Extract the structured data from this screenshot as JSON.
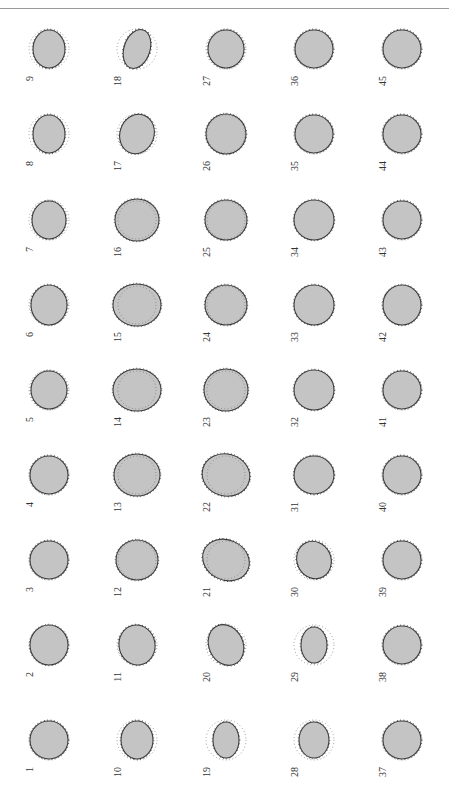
{
  "page": {
    "header_text": "",
    "page_number": "",
    "orientation": "rotated-90"
  },
  "figure": {
    "columns": [
      49,
      137,
      226,
      314,
      402
    ],
    "rows": [
      49,
      134,
      220,
      305,
      390,
      475,
      560,
      645,
      740
    ],
    "colors": {
      "fill": "#c4c4c4",
      "edge": "#3a3a3a",
      "reference": "#6a6a6a"
    },
    "panels": [
      {
        "n": "1",
        "col": 0,
        "row": 8,
        "rx": 19,
        "ry": 19,
        "rot": 0,
        "ref": 19,
        "inner": false
      },
      {
        "n": "2",
        "col": 0,
        "row": 7,
        "rx": 19,
        "ry": 20,
        "rot": 0,
        "ref": 19,
        "inner": false
      },
      {
        "n": "3",
        "col": 0,
        "row": 6,
        "rx": 19,
        "ry": 19,
        "rot": 0,
        "ref": 19,
        "inner": false
      },
      {
        "n": "4",
        "col": 0,
        "row": 5,
        "rx": 19,
        "ry": 19,
        "rot": 0,
        "ref": 19,
        "inner": false
      },
      {
        "n": "5",
        "col": 0,
        "row": 4,
        "rx": 18,
        "ry": 19,
        "rot": 0,
        "ref": 19,
        "inner": false
      },
      {
        "n": "6",
        "col": 0,
        "row": 3,
        "rx": 18,
        "ry": 20,
        "rot": 0,
        "ref": 19,
        "inner": false
      },
      {
        "n": "7",
        "col": 0,
        "row": 2,
        "rx": 17,
        "ry": 19,
        "rot": 0,
        "ref": 19,
        "inner": false
      },
      {
        "n": "8",
        "col": 0,
        "row": 1,
        "rx": 16,
        "ry": 19,
        "rot": 0,
        "ref": 19,
        "inner": false
      },
      {
        "n": "9",
        "col": 0,
        "row": 0,
        "rx": 16,
        "ry": 19,
        "rot": 0,
        "ref": 19,
        "inner": false
      },
      {
        "n": "10",
        "col": 1,
        "row": 8,
        "rx": 16,
        "ry": 19,
        "rot": 0,
        "ref": 19,
        "inner": false
      },
      {
        "n": "11",
        "col": 1,
        "row": 7,
        "rx": 18,
        "ry": 20,
        "rot": -10,
        "ref": 19,
        "inner": false
      },
      {
        "n": "12",
        "col": 1,
        "row": 6,
        "rx": 21,
        "ry": 20,
        "rot": 0,
        "ref": 19,
        "inner": true
      },
      {
        "n": "13",
        "col": 1,
        "row": 5,
        "rx": 23,
        "ry": 21,
        "rot": 0,
        "ref": 19,
        "inner": true
      },
      {
        "n": "14",
        "col": 1,
        "row": 4,
        "rx": 24,
        "ry": 21,
        "rot": 0,
        "ref": 19,
        "inner": true
      },
      {
        "n": "15",
        "col": 1,
        "row": 3,
        "rx": 24,
        "ry": 21,
        "rot": 0,
        "ref": 19,
        "inner": true
      },
      {
        "n": "16",
        "col": 1,
        "row": 2,
        "rx": 22,
        "ry": 21,
        "rot": 0,
        "ref": 19,
        "inner": true
      },
      {
        "n": "17",
        "col": 1,
        "row": 1,
        "rx": 17,
        "ry": 20,
        "rot": 20,
        "ref": 19,
        "inner": false
      },
      {
        "n": "18",
        "col": 1,
        "row": 0,
        "rx": 13,
        "ry": 20,
        "rot": 18,
        "ref": 19,
        "inner": false
      },
      {
        "n": "19",
        "col": 2,
        "row": 8,
        "rx": 13,
        "ry": 18,
        "rot": 0,
        "ref": 19,
        "inner": false
      },
      {
        "n": "20",
        "col": 2,
        "row": 7,
        "rx": 17,
        "ry": 21,
        "rot": -25,
        "ref": 19,
        "inner": false
      },
      {
        "n": "21",
        "col": 2,
        "row": 6,
        "rx": 24,
        "ry": 20,
        "rot": 25,
        "ref": 19,
        "inner": true
      },
      {
        "n": "22",
        "col": 2,
        "row": 5,
        "rx": 24,
        "ry": 21,
        "rot": 15,
        "ref": 19,
        "inner": true
      },
      {
        "n": "23",
        "col": 2,
        "row": 4,
        "rx": 22,
        "ry": 21,
        "rot": 0,
        "ref": 19,
        "inner": true
      },
      {
        "n": "24",
        "col": 2,
        "row": 3,
        "rx": 21,
        "ry": 20,
        "rot": 0,
        "ref": 19,
        "inner": true
      },
      {
        "n": "25",
        "col": 2,
        "row": 2,
        "rx": 21,
        "ry": 20,
        "rot": 0,
        "ref": 19,
        "inner": true
      },
      {
        "n": "26",
        "col": 2,
        "row": 1,
        "rx": 20,
        "ry": 20,
        "rot": 0,
        "ref": 19,
        "inner": true
      },
      {
        "n": "27",
        "col": 2,
        "row": 0,
        "rx": 18,
        "ry": 19,
        "rot": 0,
        "ref": 19,
        "inner": false
      },
      {
        "n": "28",
        "col": 3,
        "row": 8,
        "rx": 15,
        "ry": 18,
        "rot": 0,
        "ref": 19,
        "inner": false
      },
      {
        "n": "29",
        "col": 3,
        "row": 7,
        "rx": 13,
        "ry": 18,
        "rot": 0,
        "ref": 19,
        "inner": false
      },
      {
        "n": "30",
        "col": 3,
        "row": 6,
        "rx": 17,
        "ry": 19,
        "rot": -25,
        "ref": 19,
        "inner": false
      },
      {
        "n": "31",
        "col": 3,
        "row": 5,
        "rx": 20,
        "ry": 19,
        "rot": 0,
        "ref": 19,
        "inner": false
      },
      {
        "n": "32",
        "col": 3,
        "row": 4,
        "rx": 20,
        "ry": 20,
        "rot": 0,
        "ref": 19,
        "inner": false
      },
      {
        "n": "33",
        "col": 3,
        "row": 3,
        "rx": 20,
        "ry": 20,
        "rot": 0,
        "ref": 19,
        "inner": false
      },
      {
        "n": "34",
        "col": 3,
        "row": 2,
        "rx": 20,
        "ry": 20,
        "rot": 0,
        "ref": 19,
        "inner": false
      },
      {
        "n": "35",
        "col": 3,
        "row": 1,
        "rx": 19,
        "ry": 19,
        "rot": 0,
        "ref": 19,
        "inner": false
      },
      {
        "n": "36",
        "col": 3,
        "row": 0,
        "rx": 19,
        "ry": 19,
        "rot": 0,
        "ref": 19,
        "inner": false
      },
      {
        "n": "37",
        "col": 4,
        "row": 8,
        "rx": 19,
        "ry": 19,
        "rot": 0,
        "ref": 19,
        "inner": false
      },
      {
        "n": "38",
        "col": 4,
        "row": 7,
        "rx": 19,
        "ry": 19,
        "rot": 0,
        "ref": 19,
        "inner": false
      },
      {
        "n": "39",
        "col": 4,
        "row": 6,
        "rx": 19,
        "ry": 19,
        "rot": 0,
        "ref": 19,
        "inner": false
      },
      {
        "n": "40",
        "col": 4,
        "row": 5,
        "rx": 19,
        "ry": 19,
        "rot": 0,
        "ref": 19,
        "inner": false
      },
      {
        "n": "41",
        "col": 4,
        "row": 4,
        "rx": 19,
        "ry": 19,
        "rot": 0,
        "ref": 19,
        "inner": false
      },
      {
        "n": "42",
        "col": 4,
        "row": 3,
        "rx": 19,
        "ry": 20,
        "rot": 0,
        "ref": 19,
        "inner": false
      },
      {
        "n": "43",
        "col": 4,
        "row": 2,
        "rx": 19,
        "ry": 19,
        "rot": 0,
        "ref": 19,
        "inner": false
      },
      {
        "n": "44",
        "col": 4,
        "row": 1,
        "rx": 19,
        "ry": 19,
        "rot": 0,
        "ref": 19,
        "inner": false
      },
      {
        "n": "45",
        "col": 4,
        "row": 0,
        "rx": 19,
        "ry": 19,
        "rot": 0,
        "ref": 19,
        "inner": false
      }
    ]
  }
}
